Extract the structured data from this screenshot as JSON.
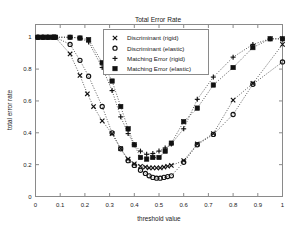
{
  "figure": {
    "title": "Total Error Rate",
    "background_color": "#ffffff",
    "frame_color": "#8a8a8a",
    "ink_color": "#111111"
  },
  "axes": {
    "xlabel": "threshold value",
    "ylabel": "total error rate",
    "xticks": [
      "0",
      "0.1",
      "0.2",
      "0.3",
      "0.4",
      "0.5",
      "0.6",
      "0.7",
      "0.8",
      "0.9",
      "1"
    ],
    "yticks": [
      "0",
      "0.2",
      "0.4",
      "0.6",
      "0.8",
      "1"
    ]
  },
  "legend": {
    "position": "top-center",
    "entries": [
      {
        "label": "Discriminant (rigid)",
        "marker": "x-marker-icon"
      },
      {
        "label": "Discriminant (elastic)",
        "marker": "circle-marker-icon"
      },
      {
        "label": "Matching Error (rigid)",
        "marker": "plus-marker-icon"
      },
      {
        "label": "Matching Error (elastic)",
        "marker": "square-marker-icon"
      }
    ]
  },
  "chart_data": {
    "type": "line",
    "title": "Total Error Rate",
    "xlabel": "threshold value",
    "ylabel": "total error rate",
    "xlim": [
      0,
      1
    ],
    "ylim": [
      0,
      1.08
    ],
    "grid": false,
    "legend_position": "top-center",
    "series": [
      {
        "name": "Discriminant (rigid)",
        "marker": "x",
        "linestyle": "dotted",
        "x": [
          0.01,
          0.03,
          0.05,
          0.07,
          0.08,
          0.14,
          0.18,
          0.21,
          0.235,
          0.27,
          0.31,
          0.345,
          0.375,
          0.4,
          0.425,
          0.445,
          0.46,
          0.475,
          0.49,
          0.505,
          0.52,
          0.535,
          0.55,
          0.6,
          0.655,
          0.72,
          0.8,
          0.88,
          1.0
        ],
        "y": [
          1.0,
          1.0,
          1.0,
          1.0,
          1.0,
          0.895,
          0.76,
          0.645,
          0.565,
          0.475,
          0.395,
          0.3,
          0.235,
          0.205,
          0.19,
          0.185,
          0.18,
          0.18,
          0.18,
          0.18,
          0.185,
          0.19,
          0.195,
          0.225,
          0.33,
          0.395,
          0.605,
          0.71,
          0.955
        ]
      },
      {
        "name": "Discriminant (elastic)",
        "marker": "o",
        "linestyle": "dotted",
        "x": [
          0.01,
          0.03,
          0.05,
          0.07,
          0.08,
          0.14,
          0.18,
          0.215,
          0.27,
          0.31,
          0.345,
          0.375,
          0.4,
          0.425,
          0.445,
          0.46,
          0.475,
          0.49,
          0.505,
          0.52,
          0.535,
          0.55,
          0.6,
          0.655,
          0.72,
          0.8,
          0.88,
          1.0
        ],
        "y": [
          1.0,
          1.0,
          1.0,
          1.0,
          1.0,
          0.955,
          0.855,
          0.755,
          0.565,
          0.4,
          0.3,
          0.225,
          0.195,
          0.165,
          0.145,
          0.13,
          0.12,
          0.115,
          0.115,
          0.12,
          0.125,
          0.13,
          0.215,
          0.325,
          0.39,
          0.515,
          0.705,
          0.845
        ]
      },
      {
        "name": "Matching Error (rigid)",
        "marker": "+",
        "linestyle": "dotted",
        "x": [
          0.01,
          0.03,
          0.05,
          0.07,
          0.08,
          0.14,
          0.18,
          0.215,
          0.27,
          0.31,
          0.345,
          0.375,
          0.4,
          0.425,
          0.45,
          0.475,
          0.5,
          0.525,
          0.55,
          0.6,
          0.655,
          0.72,
          0.8,
          0.88,
          0.95,
          1.0
        ],
        "y": [
          1.0,
          1.0,
          1.0,
          1.0,
          1.0,
          1.0,
          0.995,
          0.97,
          0.81,
          0.665,
          0.5,
          0.395,
          0.325,
          0.285,
          0.265,
          0.27,
          0.285,
          0.305,
          0.33,
          0.425,
          0.61,
          0.75,
          0.875,
          0.955,
          0.99,
          0.99
        ]
      },
      {
        "name": "Matching Error (elastic)",
        "marker": "s",
        "linestyle": "dotted",
        "x": [
          0.01,
          0.03,
          0.05,
          0.07,
          0.08,
          0.14,
          0.18,
          0.215,
          0.27,
          0.31,
          0.345,
          0.375,
          0.4,
          0.425,
          0.45,
          0.475,
          0.5,
          0.525,
          0.55,
          0.6,
          0.655,
          0.72,
          0.8,
          0.88,
          0.95,
          1.0
        ],
        "y": [
          1.0,
          1.0,
          1.0,
          1.0,
          1.0,
          1.0,
          0.995,
          0.985,
          0.84,
          0.725,
          0.565,
          0.425,
          0.325,
          0.245,
          0.235,
          0.245,
          0.245,
          0.285,
          0.335,
          0.47,
          0.555,
          0.7,
          0.81,
          0.935,
          0.99,
          0.99
        ]
      }
    ]
  }
}
